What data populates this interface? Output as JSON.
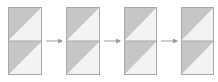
{
  "diagram": {
    "type": "sequence",
    "colors": {
      "dark_triangle": "#c6c6c6",
      "light_triangle": "#f3f3f3",
      "border": "#a8a8a8",
      "arrow": "#9a9a9a",
      "background": "#ffffff"
    },
    "blocks": [
      {
        "id": "block-1",
        "x": 8,
        "y": 7,
        "w": 34,
        "h": 68
      },
      {
        "id": "block-2",
        "x": 66,
        "y": 7,
        "w": 34,
        "h": 68
      },
      {
        "id": "block-3",
        "x": 124,
        "y": 7,
        "w": 33,
        "h": 68
      },
      {
        "id": "block-4",
        "x": 181,
        "y": 7,
        "w": 33,
        "h": 68
      }
    ],
    "arrows": [
      {
        "id": "arrow-1",
        "from": "block-1",
        "to": "block-2",
        "x1": 46,
        "x2": 62,
        "y": 41
      },
      {
        "id": "arrow-2",
        "from": "block-2",
        "to": "block-3",
        "x1": 104,
        "x2": 120,
        "y": 41
      },
      {
        "id": "arrow-3",
        "from": "block-3",
        "to": "block-4",
        "x1": 161,
        "x2": 177,
        "y": 41
      }
    ]
  }
}
